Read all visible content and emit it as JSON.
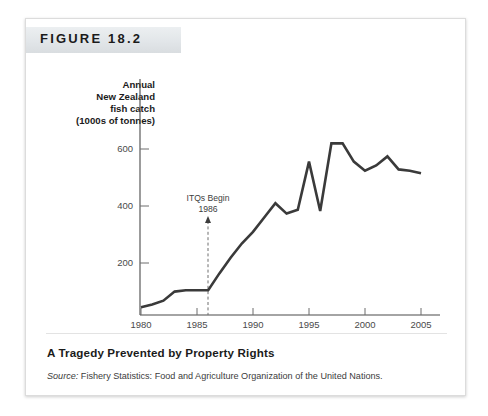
{
  "figure": {
    "header_label": "FIGURE 18.2",
    "caption_title": "A Tragedy Prevented by Property Rights",
    "source_prefix": "Source:",
    "source_text": " Fishery Statistics: Food and Agriculture Organization of the United Nations."
  },
  "chart_data": {
    "type": "line",
    "title": "A Tragedy Prevented by Property Rights",
    "ylabel_lines": [
      "Annual",
      "New Zealand",
      "fish catch",
      "(1000s of tonnes)"
    ],
    "ylabel": "Annual New Zealand fish catch (1000s of tonnes)",
    "xlabel": "Year",
    "xlim": [
      1979,
      2006
    ],
    "ylim": [
      0,
      700
    ],
    "xticks": [
      1980,
      1985,
      1990,
      1995,
      2000,
      2005
    ],
    "xtick_labels": [
      "1980",
      "1985",
      "1990",
      "1995",
      "2000",
      "2005"
    ],
    "yticks": [
      200,
      400,
      600
    ],
    "ytick_labels": [
      "200",
      "400",
      "600"
    ],
    "grid": false,
    "legend": null,
    "line_color": "#3a3a3a",
    "x": [
      1980,
      1981,
      1982,
      1983,
      1984,
      1985,
      1986,
      1987,
      1988,
      1989,
      1990,
      1991,
      1992,
      1993,
      1994,
      1995,
      1996,
      1997,
      1998,
      1999,
      2000,
      2001,
      2002,
      2003,
      2004,
      2005
    ],
    "values": [
      30,
      40,
      55,
      90,
      95,
      95,
      95,
      160,
      220,
      275,
      320,
      375,
      430,
      390,
      405,
      590,
      400,
      660,
      660,
      590,
      555,
      575,
      610,
      560,
      555,
      545
    ],
    "series": [
      {
        "name": "Annual New Zealand fish catch",
        "values": [
          30,
          40,
          55,
          90,
          95,
          95,
          95,
          160,
          220,
          275,
          320,
          375,
          430,
          390,
          405,
          590,
          400,
          660,
          660,
          590,
          555,
          575,
          610,
          560,
          555,
          545
        ]
      }
    ],
    "annotations": [
      {
        "name": "itq-marker",
        "line1": "ITQs Begin",
        "line2": "1986",
        "x": 1986,
        "style": "dashed-vertical-with-arrow"
      }
    ]
  }
}
